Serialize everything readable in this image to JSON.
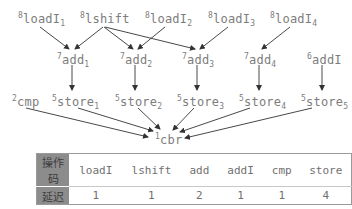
{
  "graph": {
    "nodes": {
      "loadI1": {
        "priority": "8",
        "name": "loadI",
        "sub": "1"
      },
      "lshift": {
        "priority": "8",
        "name": "lshift",
        "sub": ""
      },
      "loadI2": {
        "priority": "8",
        "name": "loadI",
        "sub": "2"
      },
      "loadI3": {
        "priority": "8",
        "name": "loadI",
        "sub": "3"
      },
      "loadI4": {
        "priority": "8",
        "name": "loadI",
        "sub": "4"
      },
      "add1": {
        "priority": "7",
        "name": "add",
        "sub": "1"
      },
      "add2": {
        "priority": "7",
        "name": "add",
        "sub": "2"
      },
      "add3": {
        "priority": "7",
        "name": "add",
        "sub": "3"
      },
      "add4": {
        "priority": "7",
        "name": "add",
        "sub": "4"
      },
      "addI": {
        "priority": "6",
        "name": "addI",
        "sub": ""
      },
      "cmp": {
        "priority": "2",
        "name": "cmp",
        "sub": ""
      },
      "store1": {
        "priority": "5",
        "name": "store",
        "sub": "1"
      },
      "store2": {
        "priority": "5",
        "name": "store",
        "sub": "2"
      },
      "store3": {
        "priority": "5",
        "name": "store",
        "sub": "3"
      },
      "store4": {
        "priority": "5",
        "name": "store",
        "sub": "4"
      },
      "store5": {
        "priority": "5",
        "name": "store",
        "sub": "5"
      },
      "cbr": {
        "priority": "1",
        "name": "cbr",
        "sub": ""
      }
    },
    "edges": [
      [
        "loadI1",
        "add1"
      ],
      [
        "lshift",
        "add1"
      ],
      [
        "lshift",
        "add2"
      ],
      [
        "lshift",
        "add3"
      ],
      [
        "loadI2",
        "add2"
      ],
      [
        "loadI3",
        "add3"
      ],
      [
        "loadI4",
        "add4"
      ],
      [
        "add1",
        "store1"
      ],
      [
        "add2",
        "store2"
      ],
      [
        "add3",
        "store3"
      ],
      [
        "add4",
        "store4"
      ],
      [
        "addI",
        "store5"
      ],
      [
        "cmp",
        "cbr"
      ],
      [
        "store1",
        "cbr"
      ],
      [
        "store2",
        "cbr"
      ],
      [
        "store3",
        "cbr"
      ],
      [
        "store4",
        "cbr"
      ],
      [
        "store5",
        "cbr"
      ]
    ]
  },
  "table": {
    "header_label": "操作码",
    "latency_label": "延迟",
    "opcodes": [
      "loadI",
      "lshift",
      "add",
      "addI",
      "cmp",
      "store"
    ],
    "latencies": [
      "1",
      "1",
      "2",
      "1",
      "1",
      "4"
    ]
  }
}
